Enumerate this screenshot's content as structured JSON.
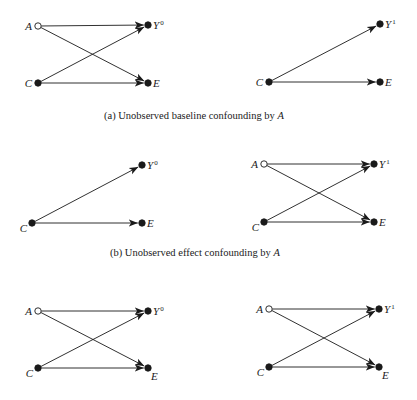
{
  "colors": {
    "ink": "#1a1a1a",
    "background": "#ffffff",
    "unobserved_node_fill": "#ffffff"
  },
  "panels": [
    {
      "id": "a",
      "caption": {
        "prefix": "(a) Unobserved baseline confounding by ",
        "var": "A",
        "x": 104,
        "y": 110
      },
      "diagrams": [
        {
          "side": "left",
          "nodes": [
            {
              "id": "A",
              "label": "A",
              "sup": "",
              "x": 38,
              "y": 26,
              "observed": false,
              "label_pos": "left"
            },
            {
              "id": "Y",
              "label": "Y",
              "sup": "0",
              "x": 148,
              "y": 25,
              "observed": true,
              "label_pos": "right"
            },
            {
              "id": "C",
              "label": "C",
              "sup": "",
              "x": 38,
              "y": 83,
              "observed": true,
              "label_pos": "left"
            },
            {
              "id": "E",
              "label": "E",
              "sup": "",
              "x": 148,
              "y": 83,
              "observed": true,
              "label_pos": "right"
            }
          ],
          "edges": [
            [
              "A",
              "Y"
            ],
            [
              "A",
              "E"
            ],
            [
              "C",
              "Y"
            ],
            [
              "C",
              "E"
            ]
          ]
        },
        {
          "side": "right",
          "nodes": [
            {
              "id": "Y",
              "label": "Y",
              "sup": "1",
              "x": 380,
              "y": 24,
              "observed": true,
              "label_pos": "right"
            },
            {
              "id": "C",
              "label": "C",
              "sup": "",
              "x": 269,
              "y": 82,
              "observed": true,
              "label_pos": "left"
            },
            {
              "id": "E",
              "label": "E",
              "sup": "",
              "x": 380,
              "y": 82,
              "observed": true,
              "label_pos": "right"
            }
          ],
          "edges": [
            [
              "C",
              "Y"
            ],
            [
              "C",
              "E"
            ]
          ]
        }
      ]
    },
    {
      "id": "b",
      "caption": {
        "prefix": "(b) Unobserved effect confounding by ",
        "var": "A",
        "x": 110,
        "y": 247
      },
      "diagrams": [
        {
          "side": "left",
          "nodes": [
            {
              "id": "Y",
              "label": "Y",
              "sup": "0",
              "x": 142,
              "y": 165,
              "observed": true,
              "label_pos": "right"
            },
            {
              "id": "C",
              "label": "C",
              "sup": "",
              "x": 32,
              "y": 223,
              "observed": true,
              "label_pos": "left-low"
            },
            {
              "id": "E",
              "label": "E",
              "sup": "",
              "x": 142,
              "y": 223,
              "observed": true,
              "label_pos": "right"
            }
          ],
          "edges": [
            [
              "C",
              "Y"
            ],
            [
              "C",
              "E"
            ]
          ]
        },
        {
          "side": "right",
          "nodes": [
            {
              "id": "A",
              "label": "A",
              "sup": "",
              "x": 264,
              "y": 164,
              "observed": false,
              "label_pos": "left"
            },
            {
              "id": "Y",
              "label": "Y",
              "sup": "1",
              "x": 374,
              "y": 164,
              "observed": true,
              "label_pos": "right"
            },
            {
              "id": "C",
              "label": "C",
              "sup": "",
              "x": 264,
              "y": 222,
              "observed": true,
              "label_pos": "left-low"
            },
            {
              "id": "E",
              "label": "E",
              "sup": "",
              "x": 374,
              "y": 222,
              "observed": true,
              "label_pos": "right"
            }
          ],
          "edges": [
            [
              "A",
              "Y"
            ],
            [
              "A",
              "E"
            ],
            [
              "C",
              "Y"
            ],
            [
              "C",
              "E"
            ]
          ]
        }
      ]
    },
    {
      "id": "c",
      "caption": null,
      "diagrams": [
        {
          "side": "left",
          "nodes": [
            {
              "id": "A",
              "label": "A",
              "sup": "",
              "x": 38,
              "y": 311,
              "observed": false,
              "label_pos": "left"
            },
            {
              "id": "Y",
              "label": "Y",
              "sup": "0",
              "x": 148,
              "y": 311,
              "observed": true,
              "label_pos": "right"
            },
            {
              "id": "C",
              "label": "C",
              "sup": "",
              "x": 38,
              "y": 368,
              "observed": true,
              "label_pos": "left-low"
            },
            {
              "id": "E",
              "label": "E",
              "sup": "",
              "x": 148,
              "y": 368,
              "observed": true,
              "label_pos": "right-low"
            }
          ],
          "edges": [
            [
              "A",
              "Y"
            ],
            [
              "A",
              "E"
            ],
            [
              "C",
              "Y"
            ],
            [
              "C",
              "E"
            ]
          ]
        },
        {
          "side": "right",
          "nodes": [
            {
              "id": "A",
              "label": "A",
              "sup": "",
              "x": 269,
              "y": 309,
              "observed": false,
              "label_pos": "left"
            },
            {
              "id": "Y",
              "label": "Y",
              "sup": "1",
              "x": 379,
              "y": 309,
              "observed": true,
              "label_pos": "right"
            },
            {
              "id": "C",
              "label": "C",
              "sup": "",
              "x": 269,
              "y": 367,
              "observed": true,
              "label_pos": "left-low"
            },
            {
              "id": "E",
              "label": "E",
              "sup": "",
              "x": 379,
              "y": 367,
              "observed": true,
              "label_pos": "right-low"
            }
          ],
          "edges": [
            [
              "A",
              "Y"
            ],
            [
              "A",
              "E"
            ],
            [
              "C",
              "Y"
            ],
            [
              "C",
              "E"
            ]
          ]
        }
      ]
    }
  ]
}
